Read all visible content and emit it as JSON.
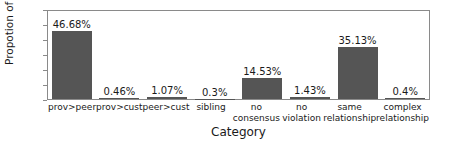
{
  "chart_data": {
    "type": "bar",
    "title": "",
    "xlabel": "Category",
    "ylabel": "Propotion of policies (%)",
    "ylim": [
      0,
      60
    ],
    "yticks": [
      60,
      50,
      40,
      30,
      20,
      10,
      0
    ],
    "grid": false,
    "legend": null,
    "bar_color": "#555555",
    "categories": [
      "prov>peer",
      "prov>cust",
      "peer>cust",
      "sibling",
      "no\nconsensus",
      "no\nviolation",
      "same\nrelationship",
      "complex\nrelationship"
    ],
    "values": [
      46.68,
      0.46,
      1.07,
      0.3,
      14.53,
      1.43,
      35.13,
      0.4
    ],
    "value_labels": [
      "46.68%",
      "0.46%",
      "1.07%",
      "0.3%",
      "14.53%",
      "1.43%",
      "35.13%",
      "0.4%"
    ]
  }
}
